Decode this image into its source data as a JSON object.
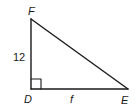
{
  "figure": {
    "type": "right-triangle",
    "vertices": {
      "F": {
        "label": "F"
      },
      "D": {
        "label": "D"
      },
      "E": {
        "label": "E"
      }
    },
    "right_angle_at": "D",
    "sides": {
      "FD": {
        "label": "12"
      },
      "DE": {
        "label": "f"
      }
    },
    "colors": {
      "stroke": "#1a1a1a",
      "background": "#ffffff"
    }
  }
}
